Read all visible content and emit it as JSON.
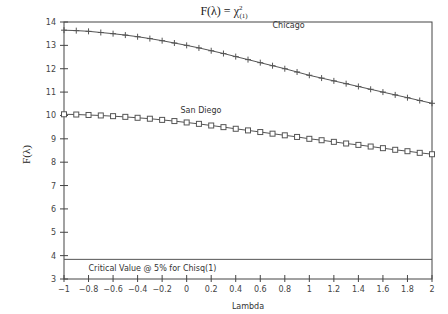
{
  "chart_data": {
    "type": "line",
    "title_parts": {
      "main": "F(λ) = χ",
      "sup": "2",
      "sub": "(1)"
    },
    "xlabel": "Lambda",
    "ylabel": "F(λ)",
    "xlim": [
      -1,
      2
    ],
    "ylim": [
      3,
      14
    ],
    "x_ticks": [
      "-1",
      "-0.8",
      "-0.6",
      "-0.4",
      "-0.2",
      "0",
      "0.2",
      "0.4",
      "0.6",
      "0.8",
      "1",
      "1.2",
      "1.4",
      "1.6",
      "1.8",
      "2"
    ],
    "y_ticks": [
      "3",
      "4",
      "5",
      "6",
      "7",
      "8",
      "9",
      "10",
      "11",
      "12",
      "13",
      "14"
    ],
    "grid": false,
    "x": [
      -1,
      -0.9,
      -0.8,
      -0.7,
      -0.6,
      -0.5,
      -0.4,
      -0.3,
      -0.2,
      -0.1,
      0,
      0.1,
      0.2,
      0.3,
      0.4,
      0.5,
      0.6,
      0.7,
      0.8,
      0.9,
      1,
      1.1,
      1.2,
      1.3,
      1.4,
      1.5,
      1.6,
      1.7,
      1.8,
      1.9,
      2
    ],
    "series": [
      {
        "name": "Chicago",
        "marker": "plus",
        "values": [
          13.65,
          13.63,
          13.6,
          13.55,
          13.5,
          13.44,
          13.37,
          13.29,
          13.2,
          13.1,
          13.0,
          12.89,
          12.77,
          12.65,
          12.52,
          12.39,
          12.26,
          12.13,
          12.0,
          11.86,
          11.72,
          11.6,
          11.48,
          11.36,
          11.24,
          11.12,
          11.0,
          10.88,
          10.76,
          10.64,
          10.52
        ]
      },
      {
        "name": "San Diego",
        "marker": "square",
        "values": [
          10.05,
          10.04,
          10.02,
          10.0,
          9.97,
          9.94,
          9.9,
          9.86,
          9.81,
          9.76,
          9.7,
          9.64,
          9.57,
          9.5,
          9.43,
          9.36,
          9.29,
          9.22,
          9.15,
          9.08,
          9.0,
          8.94,
          8.87,
          8.8,
          8.74,
          8.67,
          8.6,
          8.53,
          8.47,
          8.4,
          8.34
        ]
      }
    ],
    "reference_line": {
      "y": 3.84,
      "label": "Critical Value @ 5% for Chisq(1)"
    },
    "annotations": [
      {
        "text": "Chicago",
        "x": 0.7,
        "y": 13.75
      },
      {
        "text": "San Diego",
        "x": -0.05,
        "y": 10.1
      }
    ]
  },
  "colors": {
    "line": "#555555",
    "axis": "#444444",
    "text": "#333333"
  }
}
